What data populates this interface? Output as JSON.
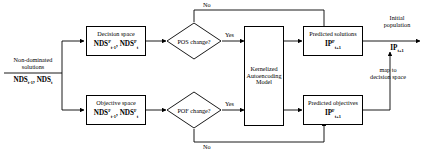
{
  "diagram": {
    "type": "flowchart",
    "stroke_color": "#000000",
    "background_color": "#ffffff"
  },
  "inputs": {
    "label_line1": "Non-dominated",
    "label_line2": "solutions",
    "symbol_prefix": "NDS",
    "symbol_sub_prev": "t-1",
    "symbol_sub_curr": "t",
    "symbol_text": "NDS_{t-1}, NDS_t"
  },
  "nodes": {
    "decision_space": {
      "title": "Decision space",
      "symbol_prefix": "NDS",
      "symbol_superscript": "P",
      "symbol_sub_prev": "t-1",
      "symbol_sub_curr": "t"
    },
    "objective_space": {
      "title": "Objective space",
      "symbol_prefix": "NDS",
      "symbol_superscript": "F",
      "symbol_sub_prev": "t-1",
      "symbol_sub_curr": "t"
    },
    "pos_decision": {
      "label": "POS change?"
    },
    "pof_decision": {
      "label": "POF change?"
    },
    "model": {
      "line1": "Kernelized",
      "line2": "Autoencoding",
      "line3": "Model"
    },
    "predicted_solutions": {
      "title": "Predicted solutions",
      "symbol_prefix": "IP",
      "symbol_superscript": "P",
      "symbol_subscript": "t+1"
    },
    "predicted_objectives": {
      "title": "Predicted objectives",
      "symbol_prefix": "IP",
      "symbol_superscript": "F",
      "symbol_subscript": "t+1"
    }
  },
  "edge_labels": {
    "pos_yes": "Yes",
    "pos_no": "No",
    "pof_yes": "Yes",
    "pof_no": "No",
    "map_line1": "map to",
    "map_line2": "decision space"
  },
  "output": {
    "label_line1": "Initial",
    "label_line2": "population",
    "symbol_prefix": "IP",
    "symbol_subscript": "t+1"
  }
}
